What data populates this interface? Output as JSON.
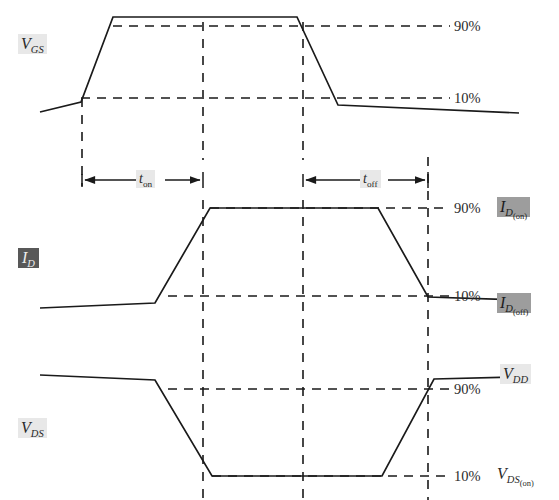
{
  "figure": {
    "background": "#ffffff",
    "stroke_color": "#1a1a1a",
    "highlight_light": "#e8e8e8",
    "highlight_mid": "#9d9d9d",
    "highlight_dark": "#585858"
  },
  "signals": {
    "vgs": {
      "symbol": "V",
      "subscript": "GS",
      "label": "V_GS",
      "highlight": "light"
    },
    "id": {
      "symbol": "I",
      "subscript": "D",
      "label": "I_D",
      "highlight": "dark"
    },
    "vds": {
      "symbol": "V",
      "subscript": "DS",
      "label": "V_DS",
      "highlight": "light"
    }
  },
  "level_labels": {
    "vgs_90": "90%",
    "vgs_10": "10%",
    "id_90": "90%",
    "id_10": "10%",
    "vds_90": "90%",
    "vds_10": "10%"
  },
  "value_labels": {
    "id_on": {
      "symbol": "I",
      "subscript": "D",
      "subsub": "(on)",
      "label": "I_D(on)",
      "highlight": "mid"
    },
    "id_off": {
      "symbol": "I",
      "subscript": "D",
      "subsub": "(off)",
      "label": "I_D(off)",
      "highlight": "mid"
    },
    "vdd": {
      "symbol": "V",
      "subscript": "DD",
      "label": "V_DD",
      "highlight": "light"
    },
    "vds_on": {
      "symbol": "V",
      "subscript": "DS",
      "subsub": "(on)",
      "label": "V_DS(on)",
      "highlight": "none"
    }
  },
  "time_intervals": {
    "t_on": {
      "symbol": "t",
      "subscript": "on",
      "label": "t_on",
      "start_x": 82,
      "end_x": 203
    },
    "t_off": {
      "symbol": "t",
      "subscript": "off",
      "label": "t_off",
      "start_x": 303,
      "end_x": 428
    }
  },
  "chart_data": {
    "type": "line",
    "xlabel": "",
    "ylabel": "",
    "grid": false,
    "legend": false,
    "xlim": [
      0,
      559
    ],
    "annotations": [
      "90%",
      "10%",
      "t_on",
      "t_off"
    ],
    "reference_lines": {
      "vertical_time_markers_x": [
        82,
        203,
        303,
        428
      ],
      "vgs_90_percent_y": 26,
      "vgs_10_percent_y": 102,
      "id_90_percent_y": 208,
      "id_10_percent_y": 297,
      "vds_90_percent_y": 380,
      "vds_10_percent_y": 476
    },
    "series": [
      {
        "name": "V_GS",
        "points": [
          [
            40,
            112
          ],
          [
            81,
            102
          ],
          [
            113,
            17
          ],
          [
            297,
            17
          ],
          [
            338,
            105
          ],
          [
            519,
            113
          ]
        ],
        "levels": {
          "low": "10%",
          "high": "90%"
        }
      },
      {
        "name": "I_D",
        "points": [
          [
            40,
            308
          ],
          [
            155,
            303
          ],
          [
            210,
            208
          ],
          [
            378,
            208
          ],
          [
            428,
            297
          ],
          [
            519,
            300
          ]
        ],
        "levels": {
          "low": "I_D(off) / 10%",
          "high": "I_D(on) / 90%"
        }
      },
      {
        "name": "V_DS",
        "points": [
          [
            40,
            375
          ],
          [
            155,
            380
          ],
          [
            212,
            476
          ],
          [
            382,
            476
          ],
          [
            434,
            379
          ],
          [
            519,
            377
          ]
        ],
        "levels": {
          "low": "V_DS(on) / 10%",
          "high": "V_DD / 90%"
        }
      }
    ]
  },
  "geometry": {
    "vgs": {
      "trace": "M 40,112 L 81,102 L 113,17 L 297,17 L 338,105 L 519,113",
      "dash_90": "M 113,26 L 450,26",
      "dash_10": "M 81,98 L 450,98"
    },
    "id": {
      "trace": "M 40,308 L 155,303 L 210,208 L 378,208 L 428,297 L 519,300",
      "dash_90": "M 210,208 L 450,208",
      "dash_10": "M 168,296 L 450,296"
    },
    "vds": {
      "trace": "M 40,375 L 155,380 L 212,476 L 382,476 L 434,379 L 519,377",
      "dash_90": "M 168,389 L 450,389",
      "dash_10": "M 212,476 L 450,476"
    },
    "time_markers": [
      {
        "name": "turn-on-start",
        "path": "M 82,98 L 82,185"
      },
      {
        "name": "turn-on-end",
        "path": "M 203,20 L 203,500"
      },
      {
        "name": "turn-off-start",
        "path": "M 303,20 L 303,500"
      },
      {
        "name": "turn-off-end",
        "path": "M 428,155 L 428,500"
      }
    ],
    "dimension_arrows": [
      {
        "name": "t-on-arrow",
        "y": 180,
        "x1": 82,
        "x2": 203
      },
      {
        "name": "t-off-arrow",
        "y": 180,
        "x1": 303,
        "x2": 428
      }
    ]
  }
}
